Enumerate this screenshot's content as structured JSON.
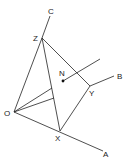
{
  "figure": {
    "points": [
      {
        "id": "O",
        "label": "O"
      },
      {
        "id": "X",
        "label": "X"
      },
      {
        "id": "Y",
        "label": "Y"
      },
      {
        "id": "Z",
        "label": "Z"
      },
      {
        "id": "N",
        "label": "N"
      },
      {
        "id": "A",
        "label": "A"
      },
      {
        "id": "B",
        "label": "B"
      },
      {
        "id": "C",
        "label": "C"
      }
    ],
    "segments": [
      [
        "O",
        "A"
      ],
      [
        "Y",
        "B"
      ],
      [
        "Z",
        "C"
      ],
      [
        "O",
        "Z"
      ],
      [
        "Z",
        "X"
      ],
      [
        "Z",
        "Y"
      ],
      [
        "X",
        "Y"
      ],
      [
        "O",
        "P1"
      ],
      [
        "O",
        "P2"
      ],
      [
        "N",
        "T"
      ]
    ]
  }
}
